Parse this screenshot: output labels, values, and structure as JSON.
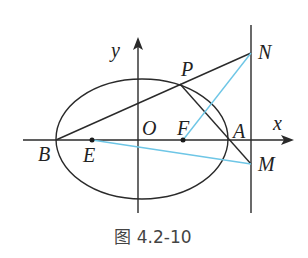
{
  "figure": {
    "caption": "图 4.2-10",
    "axes": {
      "x_label": "x",
      "y_label": "y",
      "origin_label": "O"
    },
    "points": {
      "B": "B",
      "E": "E",
      "O": "O",
      "F": "F",
      "A": "A",
      "P": "P",
      "N": "N",
      "M": "M"
    },
    "colors": {
      "line": "#2a2a2a",
      "accent": "#6ec6e6",
      "background": "#ffffff"
    },
    "elements": [
      "ellipse centered at O with vertices B and A on x-axis",
      "vertical line through N and M to the right of A",
      "segment B-P-N",
      "segment P-A-M",
      "blue segment F-N",
      "blue segment E-M",
      "points E and F marked on x-axis"
    ]
  }
}
